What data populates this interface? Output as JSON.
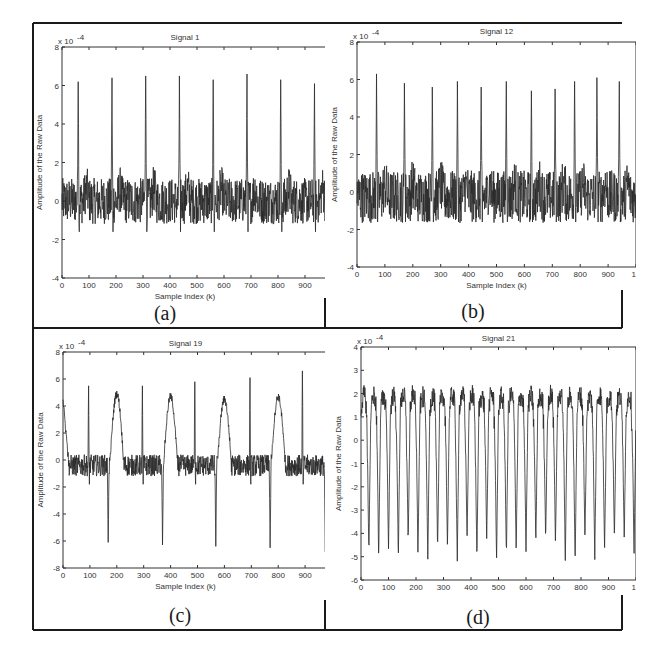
{
  "figure": {
    "panels": [
      "(a)",
      "(b)",
      "(c)",
      "(d)"
    ]
  },
  "chart_data": [
    {
      "type": "line",
      "panel_label": "(a)",
      "title": "Signal 1",
      "xlabel": "Sample Index (k)",
      "ylabel": "Amplitude of the Raw Data",
      "y_multiplier": "x 10^-4",
      "xlim": [
        0,
        1000
      ],
      "ylim": [
        -4,
        8
      ],
      "x_ticks": [
        "0",
        "100",
        "200",
        "300",
        "400",
        "500",
        "600",
        "700",
        "800",
        "900"
      ],
      "y_ticks": [
        "8",
        "6",
        "4",
        "2",
        "0",
        "-2",
        "-4"
      ],
      "grid": false,
      "description": "ECG-like raw signal with sharp positive spikes approx. every 125 samples over a noisy baseline near 0",
      "spike_positions_k": [
        60,
        185,
        310,
        435,
        560,
        685,
        810,
        935
      ],
      "spike_peaks": [
        6.2,
        6.4,
        6.5,
        6.5,
        6.3,
        6.6,
        6.3,
        6.1
      ],
      "baseline_range": [
        -1.5,
        1.5
      ]
    },
    {
      "type": "line",
      "panel_label": "(b)",
      "title": "Signal 12",
      "xlabel": "Sample Index (k)",
      "ylabel": "Amplitude of the Raw Data",
      "y_multiplier": "x 10^-4",
      "xlim": [
        0,
        1000
      ],
      "ylim": [
        -4,
        8
      ],
      "x_ticks": [
        "0",
        "100",
        "200",
        "300",
        "400",
        "500",
        "600",
        "700",
        "800",
        "900",
        "10"
      ],
      "y_ticks": [
        "8",
        "6",
        "4",
        "2",
        "0",
        "-2",
        "-4"
      ],
      "grid": false,
      "description": "ECG-like raw signal with sharp positive spikes approx. every 87 samples over a noisy baseline",
      "spike_positions_k": [
        70,
        170,
        270,
        360,
        445,
        535,
        625,
        710,
        780,
        860,
        940
      ],
      "spike_peaks": [
        6.3,
        5.8,
        5.6,
        5.9,
        5.6,
        5.9,
        5.4,
        5.5,
        5.9,
        6.1,
        5.9
      ],
      "baseline_range": [
        -2,
        1.5
      ]
    },
    {
      "type": "line",
      "panel_label": "(c)",
      "title": "Signal 19",
      "xlabel": "Sample Index (k)",
      "ylabel": "Amplitude of the Raw Data",
      "y_multiplier": "x 10^-4",
      "xlim": [
        0,
        1000
      ],
      "ylim": [
        -8,
        8
      ],
      "x_ticks": [
        "0",
        "100",
        "200",
        "300",
        "400",
        "500",
        "600",
        "700",
        "800",
        "900",
        "1"
      ],
      "y_ticks": [
        "8",
        "6",
        "4",
        "2",
        "0",
        "-2",
        "-4",
        "-6",
        "-8"
      ],
      "grid": false,
      "description": "Mixed signal: narrow positive spikes (~5.5-6.5) every ~200 samples, deep negative spikes (~-6) followed by broad positive humps (~4.5-5)",
      "positive_spike_positions_k": [
        95,
        295,
        490,
        695,
        890
      ],
      "positive_spike_peaks": [
        5.5,
        5.5,
        5.8,
        6.1,
        6.6
      ],
      "negative_spike_positions_k": [
        168,
        370,
        568,
        770,
        975
      ],
      "negative_spike_troughs": [
        -6.1,
        -6.3,
        -6.4,
        -6.5,
        -6.8
      ],
      "hump_positions_k": [
        200,
        400,
        600,
        800
      ],
      "hump_peaks": [
        4.9,
        4.7,
        4.5,
        4.7
      ],
      "baseline_range": [
        -1.5,
        1
      ]
    },
    {
      "type": "line",
      "panel_label": "(d)",
      "title": "Signal 21",
      "xlabel": "",
      "ylabel": "Amplitude of the Raw Data",
      "y_multiplier": "x 10^-4",
      "xlim": [
        0,
        1000
      ],
      "ylim": [
        -6,
        4
      ],
      "x_ticks": [
        "0",
        "100",
        "200",
        "300",
        "400",
        "500",
        "600",
        "700",
        "800",
        "900",
        "10"
      ],
      "y_ticks": [
        "4",
        "3",
        "2",
        "1",
        "0",
        "-1",
        "-2",
        "-3",
        "-4",
        "-5",
        "-6"
      ],
      "grid": false,
      "description": "Fast periodic oscillation (~28 cycles) with peaks around +2 to +2.5 and troughs from -4.2 to -5.4",
      "cycles": 28,
      "peak_range": [
        2.0,
        2.6
      ],
      "trough_range": [
        -5.4,
        -4.2
      ]
    }
  ]
}
